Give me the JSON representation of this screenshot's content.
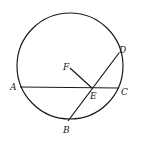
{
  "diagram": {
    "type": "geometry-circle",
    "stroke_color": "#1a1a1a",
    "circle": {
      "cx": 70,
      "cy": 66,
      "r": 53
    },
    "points": {
      "A": {
        "label": "A",
        "x": 20,
        "y": 87,
        "lx": 10,
        "ly": 90
      },
      "B": {
        "label": "B",
        "x": 68,
        "y": 121,
        "lx": 63,
        "ly": 133
      },
      "C": {
        "label": "C",
        "x": 119,
        "y": 88,
        "lx": 121,
        "ly": 95
      },
      "D": {
        "label": "D",
        "x": 119,
        "y": 53,
        "lx": 118,
        "ly": 53
      },
      "E": {
        "label": "E",
        "x": 92,
        "y": 88,
        "lx": 90,
        "ly": 99
      },
      "F": {
        "label": "F",
        "x": 70,
        "y": 68,
        "lx": 63,
        "ly": 70
      }
    },
    "segments": [
      {
        "name": "chord-AC",
        "from": "A",
        "to": "C"
      },
      {
        "name": "chord-BD",
        "from": "B",
        "to": "D"
      },
      {
        "name": "segment-FE",
        "from": "F",
        "to": "E"
      }
    ]
  }
}
